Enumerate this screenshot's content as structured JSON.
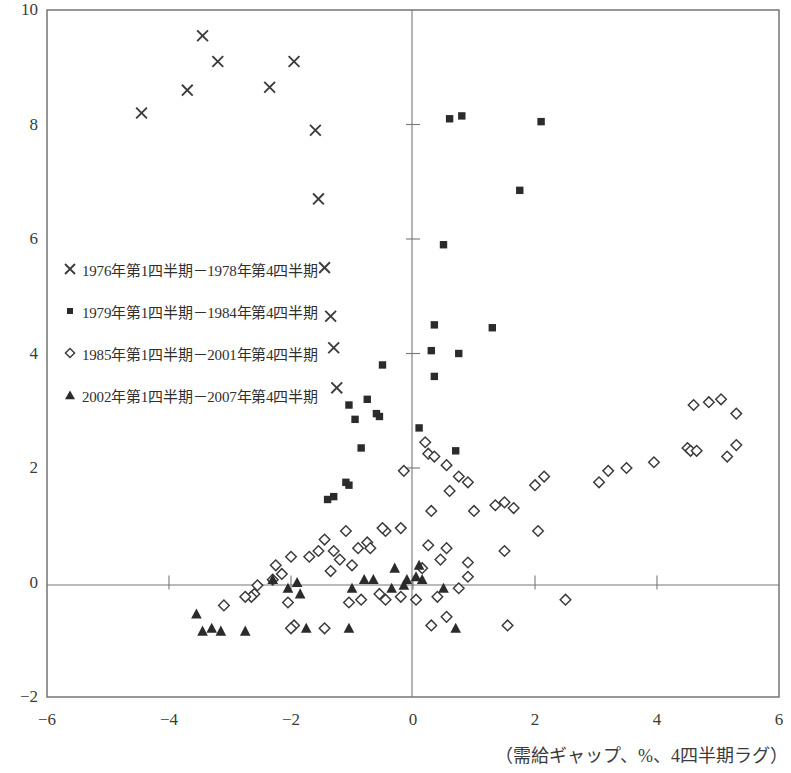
{
  "chart_data": {
    "type": "scatter",
    "title": "",
    "subtitle": "",
    "xlabel": "（需給ギャップ、%、4四半期ラグ）",
    "ylabel": "",
    "xlim": [
      -6,
      6
    ],
    "ylim": [
      -2,
      10
    ],
    "xticks": [
      "-6",
      "-4",
      "-2",
      "0",
      "2",
      "4",
      "6"
    ],
    "xtick_values": [
      -6,
      -4,
      -2,
      0,
      2,
      4,
      6
    ],
    "yticks": [
      "-2",
      "0",
      "2",
      "4",
      "6",
      "8",
      "10"
    ],
    "ytick_values": [
      -2,
      0,
      2,
      4,
      6,
      8,
      10
    ],
    "grid": false,
    "zero_lines": true,
    "legend_position": "upper-left-inside",
    "series": [
      {
        "name": "1976年第1四半期－1978年第4四半期",
        "marker": "cross",
        "color": "#3c3c3c",
        "points": [
          [
            -4.45,
            8.2
          ],
          [
            -3.7,
            8.6
          ],
          [
            -3.45,
            9.55
          ],
          [
            -3.2,
            9.1
          ],
          [
            -2.35,
            8.65
          ],
          [
            -1.95,
            9.1
          ],
          [
            -1.6,
            7.9
          ],
          [
            -1.55,
            6.7
          ],
          [
            -1.45,
            5.5
          ],
          [
            -1.35,
            4.65
          ],
          [
            -1.3,
            4.1
          ],
          [
            -1.25,
            3.4
          ]
        ]
      },
      {
        "name": "1979年第1四半期－1984年第4四半期",
        "marker": "square",
        "color": "#2b2b2b",
        "points": [
          [
            0.6,
            8.1
          ],
          [
            0.8,
            8.15
          ],
          [
            2.1,
            8.05
          ],
          [
            1.75,
            6.85
          ],
          [
            0.5,
            5.9
          ],
          [
            1.3,
            4.45
          ],
          [
            0.35,
            4.5
          ],
          [
            0.3,
            4.05
          ],
          [
            0.75,
            4.0
          ],
          [
            0.35,
            3.6
          ],
          [
            -0.5,
            3.8
          ],
          [
            -0.75,
            3.2
          ],
          [
            -1.05,
            3.1
          ],
          [
            -0.95,
            2.85
          ],
          [
            -0.55,
            2.9
          ],
          [
            -0.6,
            2.95
          ],
          [
            0.1,
            2.7
          ],
          [
            0.7,
            2.3
          ],
          [
            -0.85,
            2.35
          ],
          [
            -1.1,
            1.75
          ],
          [
            -1.05,
            1.7
          ],
          [
            -1.3,
            1.5
          ],
          [
            -1.4,
            1.45
          ]
        ]
      },
      {
        "name": "1985年第1四半期－2001年第4四半期",
        "marker": "diamond",
        "color": "#3a3a3a",
        "points": [
          [
            5.05,
            3.2
          ],
          [
            4.6,
            3.1
          ],
          [
            5.3,
            2.95
          ],
          [
            4.85,
            3.15
          ],
          [
            4.5,
            2.35
          ],
          [
            5.3,
            2.4
          ],
          [
            4.55,
            2.3
          ],
          [
            4.65,
            2.3
          ],
          [
            5.15,
            2.2
          ],
          [
            3.95,
            2.1
          ],
          [
            3.5,
            2.0
          ],
          [
            3.2,
            1.95
          ],
          [
            3.05,
            1.75
          ],
          [
            2.0,
            1.7
          ],
          [
            2.15,
            1.85
          ],
          [
            1.5,
            1.4
          ],
          [
            1.35,
            1.35
          ],
          [
            1.65,
            1.3
          ],
          [
            1.0,
            1.25
          ],
          [
            0.3,
            1.25
          ],
          [
            0.6,
            1.6
          ],
          [
            2.05,
            0.9
          ],
          [
            1.5,
            0.55
          ],
          [
            0.9,
            0.35
          ],
          [
            0.45,
            0.4
          ],
          [
            0.25,
            0.65
          ],
          [
            0.55,
            0.6
          ],
          [
            0.15,
            0.25
          ],
          [
            0.2,
            2.45
          ],
          [
            0.25,
            2.25
          ],
          [
            0.35,
            2.2
          ],
          [
            0.55,
            2.05
          ],
          [
            0.75,
            1.85
          ],
          [
            0.9,
            1.75
          ],
          [
            -0.15,
            1.95
          ],
          [
            -0.45,
            0.9
          ],
          [
            -0.5,
            0.95
          ],
          [
            -0.2,
            0.95
          ],
          [
            -0.75,
            0.7
          ],
          [
            -0.9,
            0.6
          ],
          [
            -0.7,
            0.6
          ],
          [
            -1.1,
            0.9
          ],
          [
            -1.45,
            0.75
          ],
          [
            -1.3,
            0.55
          ],
          [
            -1.55,
            0.55
          ],
          [
            -1.2,
            0.4
          ],
          [
            -1.0,
            0.3
          ],
          [
            -1.35,
            0.2
          ],
          [
            -1.7,
            0.45
          ],
          [
            -2.0,
            0.45
          ],
          [
            -2.15,
            0.15
          ],
          [
            -2.25,
            0.3
          ],
          [
            -2.3,
            0.05
          ],
          [
            -2.55,
            -0.05
          ],
          [
            -2.6,
            -0.2
          ],
          [
            -2.65,
            -0.25
          ],
          [
            -2.75,
            -0.25
          ],
          [
            -3.1,
            -0.4
          ],
          [
            -2.05,
            -0.35
          ],
          [
            -1.95,
            -0.75
          ],
          [
            -2.0,
            -0.8
          ],
          [
            -1.45,
            -0.8
          ],
          [
            -0.55,
            -0.2
          ],
          [
            -0.45,
            -0.3
          ],
          [
            -0.2,
            -0.25
          ],
          [
            0.05,
            -0.3
          ],
          [
            0.4,
            -0.25
          ],
          [
            0.55,
            -0.6
          ],
          [
            0.3,
            -0.75
          ],
          [
            1.55,
            -0.75
          ],
          [
            2.5,
            -0.3
          ],
          [
            -0.85,
            -0.3
          ],
          [
            -1.05,
            -0.35
          ],
          [
            0.9,
            0.1
          ],
          [
            0.75,
            -0.1
          ]
        ]
      },
      {
        "name": "2002年第1四半期－2007年第4四半期",
        "marker": "triangle",
        "color": "#2b2b2b",
        "points": [
          [
            -3.55,
            -0.55
          ],
          [
            -3.3,
            -0.8
          ],
          [
            -3.45,
            -0.85
          ],
          [
            -3.15,
            -0.85
          ],
          [
            -2.75,
            -0.85
          ],
          [
            -2.3,
            0.05
          ],
          [
            -2.05,
            -0.1
          ],
          [
            -1.85,
            -0.2
          ],
          [
            -1.9,
            0.0
          ],
          [
            -1.75,
            -0.8
          ],
          [
            -1.05,
            -0.8
          ],
          [
            -1.0,
            -0.1
          ],
          [
            -0.35,
            -0.1
          ],
          [
            -0.3,
            0.25
          ],
          [
            -0.1,
            0.05
          ],
          [
            0.1,
            0.3
          ],
          [
            0.15,
            0.05
          ],
          [
            0.5,
            -0.1
          ],
          [
            0.7,
            -0.8
          ],
          [
            -0.65,
            0.05
          ],
          [
            -0.15,
            -0.05
          ],
          [
            -0.8,
            0.05
          ],
          [
            0.05,
            0.1
          ]
        ]
      }
    ]
  },
  "legend": {
    "items": [
      {
        "symbol": "cross-marker",
        "label": "1976年第1四半期－1978年第4四半期"
      },
      {
        "symbol": "square-marker",
        "label": "1979年第1四半期－1984年第4四半期"
      },
      {
        "symbol": "diamond-marker",
        "label": "1985年第1四半期－2001年第4四半期"
      },
      {
        "symbol": "triangle-marker",
        "label": "2002年第1四半期－2007年第4四半期"
      }
    ]
  },
  "colors": {
    "marker": "#333333",
    "axis": "#5a5a5a",
    "frame": "#6b6b6b",
    "text": "#3a3a3a",
    "background": "#ffffff"
  }
}
